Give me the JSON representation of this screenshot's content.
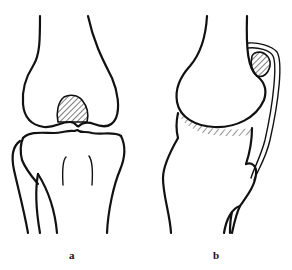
{
  "figure": {
    "panels": [
      {
        "id": "a",
        "label": "a",
        "view": "anterior knee joint"
      },
      {
        "id": "b",
        "label": "b",
        "view": "lateral knee joint"
      }
    ],
    "colors": {
      "line": "#111111",
      "background": "#ffffff",
      "hatch": "#111111"
    }
  }
}
